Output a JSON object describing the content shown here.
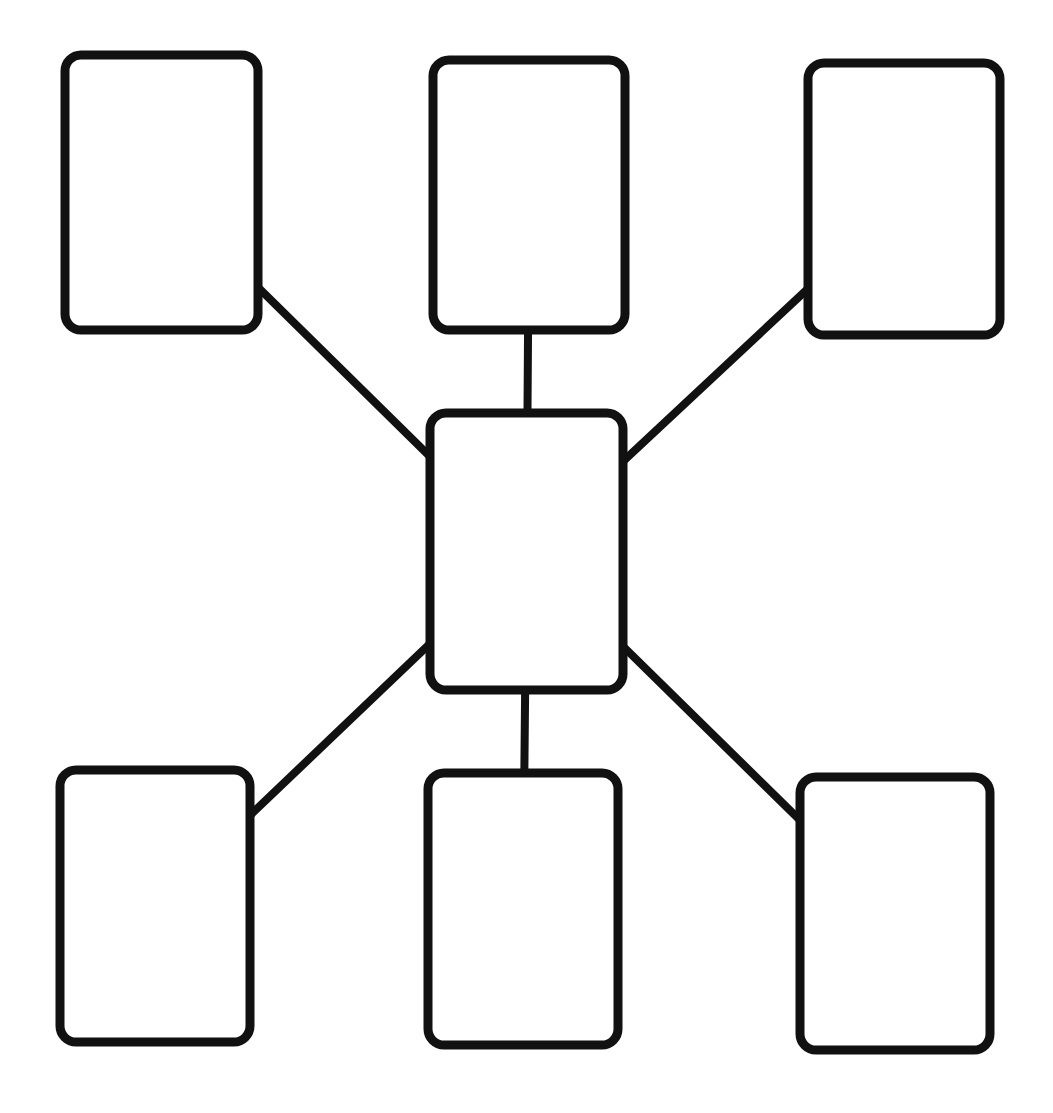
{
  "diagram": {
    "title": "",
    "background_color": "#ffffff",
    "stroke_color": "#111111",
    "node_fill_color": "#ffffff",
    "node_border_width": 9,
    "connector_width": 8,
    "corner_radius": 16,
    "canvas": {
      "width": 1053,
      "height": 1113
    },
    "nodes": [
      {
        "id": "center",
        "label": "",
        "x": 430,
        "y": 413,
        "w": 193,
        "h": 277
      },
      {
        "id": "top-left",
        "label": "",
        "x": 65,
        "y": 55,
        "w": 193,
        "h": 275
      },
      {
        "id": "top-middle",
        "label": "",
        "x": 433,
        "y": 60,
        "w": 192,
        "h": 270
      },
      {
        "id": "top-right",
        "label": "",
        "x": 808,
        "y": 63,
        "w": 192,
        "h": 272
      },
      {
        "id": "bottom-left",
        "label": "",
        "x": 60,
        "y": 770,
        "w": 190,
        "h": 272
      },
      {
        "id": "bottom-middle",
        "label": "",
        "x": 428,
        "y": 773,
        "w": 190,
        "h": 272
      },
      {
        "id": "bottom-right",
        "label": "",
        "x": 800,
        "y": 777,
        "w": 190,
        "h": 273
      }
    ],
    "edges": [
      {
        "from": "center",
        "to": "top-left"
      },
      {
        "from": "center",
        "to": "top-middle"
      },
      {
        "from": "center",
        "to": "top-right"
      },
      {
        "from": "center",
        "to": "bottom-left"
      },
      {
        "from": "center",
        "to": "bottom-middle"
      },
      {
        "from": "center",
        "to": "bottom-right"
      }
    ]
  }
}
